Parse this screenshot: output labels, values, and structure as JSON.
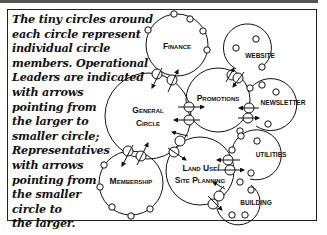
{
  "caption": {
    "lines": [
      "The tiny circles around",
      "each circle represent",
      "individual circle",
      "members. Operational",
      "Leaders are indicated",
      "with arrows",
      "pointing from",
      "the larger to",
      "smaller circle;",
      "Representatives",
      "with arrows",
      "pointing from",
      "the smaller",
      "circle to",
      "the larger."
    ]
  },
  "circles": {
    "general": {
      "label_line1": "General",
      "label_line2": "Circle"
    },
    "finance": {
      "label": "Finance"
    },
    "promotions": {
      "label": "Promotions"
    },
    "land_use": {
      "label_line1": "Land Use/",
      "label_line2": "Site Planning"
    },
    "membership": {
      "label": "Membership"
    },
    "website": {
      "label": "Website"
    },
    "newsletter": {
      "label": "Newsletter"
    },
    "utilities": {
      "label": "Utilities"
    },
    "building": {
      "label": "Building"
    }
  },
  "colors": {
    "stroke": "#111111",
    "background": "#ffffff"
  }
}
